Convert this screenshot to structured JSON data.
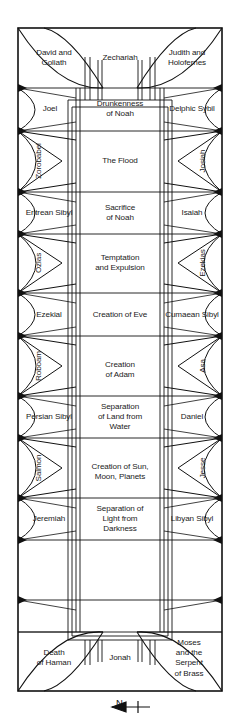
{
  "diagram": {
    "orientation": {
      "label": "N",
      "arrow_icon": "north-arrow-icon"
    },
    "frame": {
      "stroke": "#111111",
      "fill": "#ffffff"
    },
    "rows": [
      {
        "type": "corner",
        "left": "David and\nGoliath",
        "center": "Zechariah",
        "right": "Judith and\nHolofernes"
      },
      {
        "type": "seer",
        "left": "Joel",
        "center": "Drunkenness\nof Noah",
        "right": "Delphic Sybil"
      },
      {
        "type": "spandrel",
        "left": "Zorobabel",
        "center": "The Flood",
        "right": "Josiah"
      },
      {
        "type": "seer",
        "left": "Eritrean Sibyl",
        "center": "Sacrifice\nof Noah",
        "right": "Isaiah"
      },
      {
        "type": "spandrel",
        "left": "Ozias",
        "center": "Temptation\nand Expulsion",
        "right": "Ezekias"
      },
      {
        "type": "seer",
        "left": "Ezekial",
        "center": "Creation of Eve",
        "right": "Cumaean Sibyl"
      },
      {
        "type": "spandrel",
        "left": "Roboam",
        "center": "Creation\nof Adam",
        "right": "Asa"
      },
      {
        "type": "seer",
        "left": "Persian Sibyl",
        "center": "Separation\nof Land from\nWater",
        "right": "Daniel"
      },
      {
        "type": "spandrel",
        "left": "Salmon",
        "center": "Creation of Sun,\nMoon, Planets",
        "right": "Jesse"
      },
      {
        "type": "seer",
        "left": "Jeremiah",
        "center": "Separation of\nLight from\nDarkness",
        "right": "Libyan Sibyl"
      },
      {
        "type": "corner",
        "left": "Death\nof Haman",
        "center": "Jonah",
        "right": "Moses\nand the\nSerpent\nof Brass"
      }
    ]
  }
}
